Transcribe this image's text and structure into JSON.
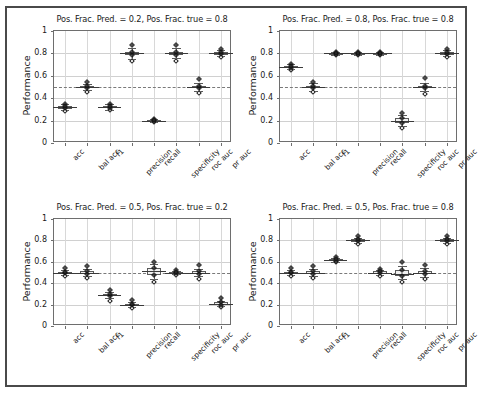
{
  "figure": {
    "width": 474,
    "height": 402,
    "background": "#ffffff",
    "frame_color": "#4a4a4a"
  },
  "chart_data": {
    "type": "box",
    "title": "",
    "xlabel": "",
    "ylabel": "Performance",
    "ylim": [
      0,
      1
    ],
    "ytick_labels": [
      "0",
      "0.2",
      "0.4",
      "0.6",
      "0.8",
      "1"
    ],
    "ytick_values": [
      0,
      0.2,
      0.4,
      0.6,
      0.8,
      1
    ],
    "grid": true,
    "legend": "none",
    "reference_line": 0.5,
    "reference_line_style": "dashed",
    "categories": [
      "acc",
      "bal acc",
      "f1",
      "precision",
      "recall",
      "specificity",
      "roc auc",
      "pr auc"
    ],
    "panels": [
      {
        "id": "panel-top-left",
        "title": "Pos. Frac. Pred. = 0.2, Pos. Frac. true = 0.8",
        "pos_frac_pred": 0.2,
        "pos_frac_true": 0.8,
        "boxes": [
          {
            "category": "acc",
            "median": 0.32,
            "q1": 0.31,
            "q3": 0.33,
            "whisker_low": 0.295,
            "whisker_high": 0.345,
            "outliers": [
              0.29,
              0.35
            ]
          },
          {
            "category": "bal acc",
            "median": 0.5,
            "q1": 0.49,
            "q3": 0.512,
            "whisker_low": 0.47,
            "whisker_high": 0.53,
            "outliers": [
              0.455,
              0.545
            ]
          },
          {
            "category": "f1",
            "median": 0.32,
            "q1": 0.31,
            "q3": 0.332,
            "whisker_low": 0.298,
            "whisker_high": 0.348,
            "outliers": [
              0.292,
              0.352
            ]
          },
          {
            "category": "precision",
            "median": 0.8,
            "q1": 0.786,
            "q3": 0.814,
            "whisker_low": 0.752,
            "whisker_high": 0.848,
            "outliers": [
              0.735,
              0.872
            ]
          },
          {
            "category": "recall",
            "median": 0.2,
            "q1": 0.194,
            "q3": 0.206,
            "whisker_low": 0.188,
            "whisker_high": 0.212,
            "outliers": [
              0.186,
              0.214
            ]
          },
          {
            "category": "specificity",
            "median": 0.8,
            "q1": 0.787,
            "q3": 0.813,
            "whisker_low": 0.755,
            "whisker_high": 0.846,
            "outliers": [
              0.736,
              0.872
            ]
          },
          {
            "category": "roc auc",
            "median": 0.5,
            "q1": 0.489,
            "q3": 0.512,
            "whisker_low": 0.466,
            "whisker_high": 0.535,
            "outliers": [
              0.442,
              0.572
            ]
          },
          {
            "category": "pr auc",
            "median": 0.8,
            "q1": 0.791,
            "q3": 0.81,
            "whisker_low": 0.776,
            "whisker_high": 0.826,
            "outliers": [
              0.772,
              0.838
            ]
          }
        ]
      },
      {
        "id": "panel-top-right",
        "title": "Pos. Frac. Pred. = 0.8, Pos. Frac. true = 0.8",
        "pos_frac_pred": 0.8,
        "pos_frac_true": 0.8,
        "boxes": [
          {
            "category": "acc",
            "median": 0.68,
            "q1": 0.672,
            "q3": 0.69,
            "whisker_low": 0.66,
            "whisker_high": 0.702,
            "outliers": [
              0.655,
              0.706
            ]
          },
          {
            "category": "bal acc",
            "median": 0.5,
            "q1": 0.489,
            "q3": 0.512,
            "whisker_low": 0.466,
            "whisker_high": 0.534,
            "outliers": [
              0.455,
              0.546
            ]
          },
          {
            "category": "f1",
            "median": 0.8,
            "q1": 0.795,
            "q3": 0.805,
            "whisker_low": 0.789,
            "whisker_high": 0.811,
            "outliers": [
              0.786,
              0.814
            ]
          },
          {
            "category": "precision",
            "median": 0.8,
            "q1": 0.795,
            "q3": 0.805,
            "whisker_low": 0.789,
            "whisker_high": 0.811,
            "outliers": [
              0.786,
              0.814
            ]
          },
          {
            "category": "recall",
            "median": 0.8,
            "q1": 0.795,
            "q3": 0.805,
            "whisker_low": 0.789,
            "whisker_high": 0.811,
            "outliers": [
              0.786,
              0.814
            ]
          },
          {
            "category": "specificity",
            "median": 0.2,
            "q1": 0.182,
            "q3": 0.22,
            "whisker_low": 0.15,
            "whisker_high": 0.252,
            "outliers": [
              0.132,
              0.272
            ]
          },
          {
            "category": "roc auc",
            "median": 0.5,
            "q1": 0.489,
            "q3": 0.512,
            "whisker_low": 0.466,
            "whisker_high": 0.535,
            "outliers": [
              0.438,
              0.576
            ]
          },
          {
            "category": "pr auc",
            "median": 0.8,
            "q1": 0.791,
            "q3": 0.81,
            "whisker_low": 0.776,
            "whisker_high": 0.826,
            "outliers": [
              0.77,
              0.84
            ]
          }
        ]
      },
      {
        "id": "panel-bottom-left",
        "title": "Pos. Frac. Pred. = 0.5, Pos. Frac. true = 0.2",
        "pos_frac_pred": 0.5,
        "pos_frac_true": 0.2,
        "boxes": [
          {
            "category": "acc",
            "median": 0.5,
            "q1": 0.492,
            "q3": 0.509,
            "whisker_low": 0.478,
            "whisker_high": 0.522,
            "outliers": [
              0.466,
              0.538
            ]
          },
          {
            "category": "bal acc",
            "median": 0.5,
            "q1": 0.489,
            "q3": 0.512,
            "whisker_low": 0.466,
            "whisker_high": 0.535,
            "outliers": [
              0.445,
              0.565
            ]
          },
          {
            "category": "f1",
            "median": 0.29,
            "q1": 0.278,
            "q3": 0.3,
            "whisker_low": 0.26,
            "whisker_high": 0.318,
            "outliers": [
              0.238,
              0.34
            ]
          },
          {
            "category": "precision",
            "median": 0.2,
            "q1": 0.192,
            "q3": 0.209,
            "whisker_low": 0.18,
            "whisker_high": 0.222,
            "outliers": [
              0.172,
              0.244
            ]
          },
          {
            "category": "recall",
            "median": 0.51,
            "q1": 0.478,
            "q3": 0.54,
            "whisker_low": 0.44,
            "whisker_high": 0.575,
            "outliers": [
              0.412,
              0.598
            ]
          },
          {
            "category": "specificity",
            "median": 0.5,
            "q1": 0.493,
            "q3": 0.508,
            "whisker_low": 0.482,
            "whisker_high": 0.518,
            "outliers": [
              0.478,
              0.524
            ]
          },
          {
            "category": "roc auc",
            "median": 0.5,
            "q1": 0.489,
            "q3": 0.512,
            "whisker_low": 0.466,
            "whisker_high": 0.535,
            "outliers": [
              0.438,
              0.572
            ]
          },
          {
            "category": "pr auc",
            "median": 0.21,
            "q1": 0.2,
            "q3": 0.222,
            "whisker_low": 0.186,
            "whisker_high": 0.238,
            "outliers": [
              0.182,
              0.258
            ]
          }
        ]
      },
      {
        "id": "panel-bottom-right",
        "title": "Pos. Frac. Pred. = 0.5, Pos. Frac. true = 0.8",
        "pos_frac_pred": 0.5,
        "pos_frac_true": 0.8,
        "boxes": [
          {
            "category": "acc",
            "median": 0.5,
            "q1": 0.492,
            "q3": 0.509,
            "whisker_low": 0.48,
            "whisker_high": 0.521,
            "outliers": [
              0.466,
              0.538
            ]
          },
          {
            "category": "bal acc",
            "median": 0.5,
            "q1": 0.489,
            "q3": 0.512,
            "whisker_low": 0.466,
            "whisker_high": 0.535,
            "outliers": [
              0.444,
              0.56
            ]
          },
          {
            "category": "f1",
            "median": 0.62,
            "q1": 0.612,
            "q3": 0.628,
            "whisker_low": 0.602,
            "whisker_high": 0.638,
            "outliers": [
              0.596,
              0.646
            ]
          },
          {
            "category": "precision",
            "median": 0.8,
            "q1": 0.792,
            "q3": 0.81,
            "whisker_low": 0.778,
            "whisker_high": 0.824,
            "outliers": [
              0.765,
              0.84
            ]
          },
          {
            "category": "recall",
            "median": 0.5,
            "q1": 0.492,
            "q3": 0.51,
            "whisker_low": 0.48,
            "whisker_high": 0.522,
            "outliers": [
              0.47,
              0.53
            ]
          },
          {
            "category": "specificity",
            "median": 0.49,
            "q1": 0.47,
            "q3": 0.52,
            "whisker_low": 0.442,
            "whisker_high": 0.562,
            "outliers": [
              0.412,
              0.598
            ]
          },
          {
            "category": "roc auc",
            "median": 0.5,
            "q1": 0.482,
            "q3": 0.516,
            "whisker_low": 0.46,
            "whisker_high": 0.54,
            "outliers": [
              0.438,
              0.57
            ]
          },
          {
            "category": "pr auc",
            "median": 0.8,
            "q1": 0.791,
            "q3": 0.81,
            "whisker_low": 0.777,
            "whisker_high": 0.826,
            "outliers": [
              0.77,
              0.84
            ]
          }
        ]
      }
    ]
  }
}
